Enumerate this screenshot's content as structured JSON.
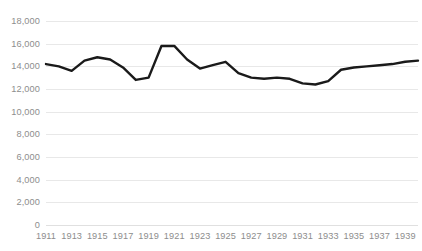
{
  "chart_data": {
    "type": "line",
    "title": "",
    "subtitle": "",
    "xlabel": "",
    "ylabel": "",
    "grid": true,
    "legend": false,
    "legend_position": "none",
    "line_color": "#1a1a1a",
    "line_width": 2.4,
    "gridline_color": "#e8e8e8",
    "tick_label_color": "#8d8d8d",
    "background_color": "#ffffff",
    "ylim": [
      0,
      18000
    ],
    "ytick_values": [
      0,
      2000,
      4000,
      6000,
      8000,
      10000,
      12000,
      14000,
      16000,
      18000
    ],
    "ytick_labels": [
      "0",
      "2,000",
      "4,000",
      "6,000",
      "8,000",
      "10,000",
      "12,000",
      "14,000",
      "16,000",
      "18,000"
    ],
    "xlim": [
      1911,
      1940
    ],
    "xtick_values": [
      1911,
      1913,
      1915,
      1917,
      1919,
      1921,
      1923,
      1925,
      1927,
      1929,
      1931,
      1933,
      1935,
      1937,
      1939
    ],
    "xtick_labels": [
      "1911",
      "1913",
      "1915",
      "1917",
      "1919",
      "1921",
      "1923",
      "1925",
      "1927",
      "1929",
      "1931",
      "1933",
      "1935",
      "1937",
      "1939"
    ],
    "x": [
      1911,
      1912,
      1913,
      1914,
      1915,
      1916,
      1917,
      1918,
      1919,
      1920,
      1921,
      1922,
      1923,
      1924,
      1925,
      1926,
      1927,
      1928,
      1929,
      1930,
      1931,
      1932,
      1933,
      1934,
      1935,
      1936,
      1937,
      1938,
      1939,
      1940
    ],
    "values": [
      14200,
      14000,
      13600,
      14500,
      14800,
      14600,
      13900,
      12800,
      13000,
      15800,
      15800,
      14600,
      13800,
      14100,
      14400,
      13400,
      13000,
      12900,
      13000,
      12900,
      12500,
      12400,
      12700,
      13700,
      13900,
      14000,
      14100,
      14200,
      14400,
      14500
    ],
    "series": [
      {
        "name": "Series 1",
        "values": [
          14200,
          14000,
          13600,
          14500,
          14800,
          14600,
          13900,
          12800,
          13000,
          15800,
          15800,
          14600,
          13800,
          14100,
          14400,
          13400,
          13000,
          12900,
          13000,
          12900,
          12500,
          12400,
          12700,
          13700,
          13900,
          14000,
          14100,
          14200,
          14400,
          14500
        ]
      }
    ]
  }
}
